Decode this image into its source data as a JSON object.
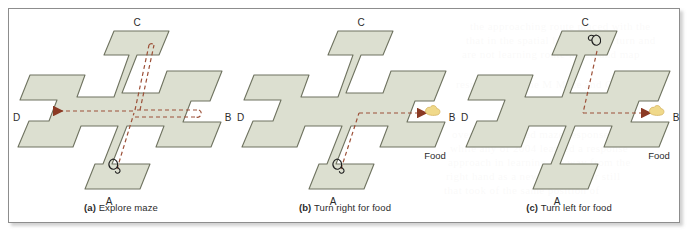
{
  "figure": {
    "type": "illustration",
    "background_color": "#ffffff",
    "frame_border_color": "#8d8d8d",
    "maze_fill_color": "#dcdfd0",
    "maze_stroke_color": "#6f7360",
    "path_color": "#9c5038",
    "arrow_color": "#8b3a24",
    "food_color": "#f0d98a",
    "mouse_color": "#1d1d1d"
  },
  "panels": [
    {
      "id": "a",
      "caption_label": "(a)",
      "caption_text": "Explore maze",
      "arm_labels": {
        "north": "C",
        "east": "B",
        "south": "A",
        "west": "D"
      },
      "food_label": null,
      "mouse_at": "A",
      "paths": [
        "A to center",
        "center to C and back",
        "center to B and back",
        "center to D"
      ],
      "arrows": [
        "D"
      ]
    },
    {
      "id": "b",
      "caption_label": "(b)",
      "caption_text": "Turn right for food",
      "arm_labels": {
        "north": "C",
        "east": "B",
        "south": "A",
        "west": "D"
      },
      "food_label": "Food",
      "food_at": "B",
      "mouse_at": "A",
      "paths": [
        "A to center",
        "center to B"
      ],
      "arrows": [
        "B"
      ]
    },
    {
      "id": "c",
      "caption_label": "(c)",
      "caption_text": "Turn left for food",
      "arm_labels": {
        "north": "C",
        "east": "B",
        "south": "A",
        "west": "D"
      },
      "food_label": "Food",
      "food_at": "B",
      "mouse_at": "C",
      "paths": [
        "C to center",
        "center to B"
      ],
      "arrows": [
        "B"
      ]
    }
  ],
  "bleed_text": [
    {
      "x": 470,
      "y": 20,
      "text": "the approaching route placed with the"
    },
    {
      "x": 466,
      "y": 34,
      "text": "that in the spatial learning of a turn and"
    },
    {
      "x": 462,
      "y": 48,
      "text": "are not learning route-based and map"
    },
    {
      "x": 456,
      "y": 78,
      "text": "responding to the M Maze and C in a"
    },
    {
      "x": 452,
      "y": 128,
      "text": "over actual-based maze response"
    },
    {
      "x": 450,
      "y": 142,
      "text": "while any of 2004 learned a response"
    },
    {
      "x": 448,
      "y": 156,
      "text": "approach in learning the way from the"
    },
    {
      "x": 446,
      "y": 170,
      "text": "right hand as a new learning for still"
    },
    {
      "x": 444,
      "y": 184,
      "text": "that took of the same position of"
    }
  ]
}
